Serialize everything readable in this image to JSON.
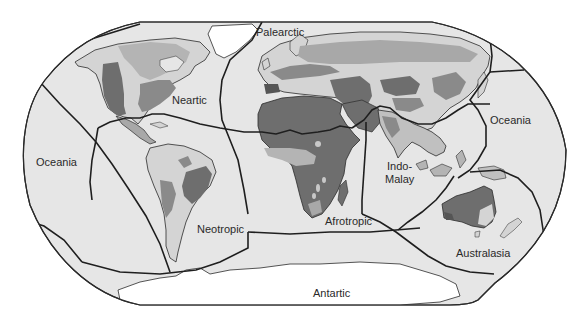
{
  "map": {
    "title": "Biogeographic realms",
    "projection": "rounded-rectangle world map",
    "colors": {
      "page_background": "#ffffff",
      "ocean": "#e6e6e6",
      "outline": "#2b2b2b",
      "boundary": "#1f1f1f",
      "ice": "#ffffff",
      "shade_light": "#d4d4d4",
      "shade_mid": "#a8a8a8",
      "shade_dark": "#6e6e6e",
      "shade_darkest": "#555555",
      "label": "#2a2a2a"
    },
    "realms": [
      {
        "id": "palearctic",
        "label": "Palearctic"
      },
      {
        "id": "nearctic",
        "label": "Neartic"
      },
      {
        "id": "oceania-west",
        "label": "Oceania"
      },
      {
        "id": "oceania-east",
        "label": "Oceania"
      },
      {
        "id": "neotropic",
        "label": "Neotropic"
      },
      {
        "id": "afrotropic",
        "label": "Afrotropic"
      },
      {
        "id": "indo-malay-line1",
        "label": "Indo-"
      },
      {
        "id": "indo-malay-line2",
        "label": "Malay"
      },
      {
        "id": "australasia",
        "label": "Australasia"
      },
      {
        "id": "antarctic",
        "label": "Antartic"
      }
    ]
  }
}
